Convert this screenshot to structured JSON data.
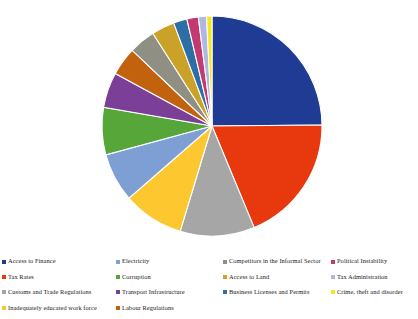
{
  "chart_data": {
    "type": "pie",
    "title": "",
    "subtitle": "",
    "xlabel": "",
    "ylabel": "",
    "legend_position": "bottom",
    "grid": false,
    "start_angle_deg": 0,
    "direction": "clockwise",
    "categories": [
      "Access to Finance",
      "Tax Rates",
      "Customs and Trade Regulations",
      "Inadequately educated work force",
      "Electricity",
      "Corruption",
      "Transport Infrastructure",
      "Labour Regulations",
      "Competitors in the Informal Sector",
      "Access to Land",
      "Business Licenses and Permits",
      "Political Instability",
      "Tax Administration",
      "Crime, theft and disorder"
    ],
    "values": [
      25.0,
      19.0,
      11.0,
      9.0,
      7.2,
      7.0,
      5.2,
      4.2,
      3.9,
      3.4,
      2.0,
      1.7,
      1.2,
      0.8
    ],
    "colors": [
      "#1f3b93",
      "#e8380d",
      "#a6a6a6",
      "#fdc82f",
      "#7e9fd4",
      "#57a63a",
      "#7b3f98",
      "#c2620f",
      "#8f8f84",
      "#c9a227",
      "#2e6ea6",
      "#c23a72",
      "#b0b7e0",
      "#f4e71e"
    ],
    "slices": [
      {
        "label": "Access to Finance",
        "value": 25.0,
        "color": "#1f3b93"
      },
      {
        "label": "Tax Rates",
        "value": 19.0,
        "color": "#e8380d"
      },
      {
        "label": "Customs and Trade Regulations",
        "value": 11.0,
        "color": "#a6a6a6"
      },
      {
        "label": "Inadequately educated work force",
        "value": 9.0,
        "color": "#fdc82f"
      },
      {
        "label": "Electricity",
        "value": 7.2,
        "color": "#7e9fd4"
      },
      {
        "label": "Corruption",
        "value": 7.0,
        "color": "#57a63a"
      },
      {
        "label": "Transport Infrastructure",
        "value": 5.2,
        "color": "#7b3f98"
      },
      {
        "label": "Labour Regulations",
        "value": 4.2,
        "color": "#c2620f"
      },
      {
        "label": "Competitors in the Informal Sector",
        "value": 3.9,
        "color": "#8f8f84"
      },
      {
        "label": "Access to Land",
        "value": 3.4,
        "color": "#c9a227"
      },
      {
        "label": "Business Licenses and Permits",
        "value": 2.0,
        "color": "#2e6ea6"
      },
      {
        "label": "Political Instability",
        "value": 1.7,
        "color": "#c23a72"
      },
      {
        "label": "Tax Administration",
        "value": 1.2,
        "color": "#b0b7e0"
      },
      {
        "label": "Crime, theft and disorder",
        "value": 0.8,
        "color": "#f4e71e"
      }
    ]
  },
  "legend": {
    "columns": [
      {
        "items": [
          {
            "label": "Access to Finance",
            "color": "#1f3b93"
          },
          {
            "label": "Tax Rates",
            "color": "#e8380d"
          },
          {
            "label": "Customs and Trade Regulations",
            "color": "#a6a6a6"
          },
          {
            "label": "Inadequately educated work force",
            "color": "#fdc82f"
          }
        ]
      },
      {
        "items": [
          {
            "label": "Electricity",
            "color": "#7e9fd4"
          },
          {
            "label": "Corruption",
            "color": "#57a63a"
          },
          {
            "label": "Transport Infrastructure",
            "color": "#7b3f98"
          },
          {
            "label": "Labour Regulations",
            "color": "#c2620f"
          }
        ]
      },
      {
        "items": [
          {
            "label": "Competitors in the Informal Sector",
            "color": "#8f8f84"
          },
          {
            "label": "Access to Land",
            "color": "#c9a227"
          },
          {
            "label": "Business Licenses and Permits",
            "color": "#2e6ea6"
          },
          {
            "label": "",
            "color": ""
          }
        ]
      },
      {
        "items": [
          {
            "label": "Political Instability",
            "color": "#c23a72"
          },
          {
            "label": "Tax Administration",
            "color": "#b0b7e0"
          },
          {
            "label": "Crime, theft and disorder",
            "color": "#f4e71e"
          },
          {
            "label": "",
            "color": ""
          }
        ]
      }
    ]
  },
  "geometry": {
    "center_x": 212,
    "center_y": 126,
    "radius": 110
  }
}
